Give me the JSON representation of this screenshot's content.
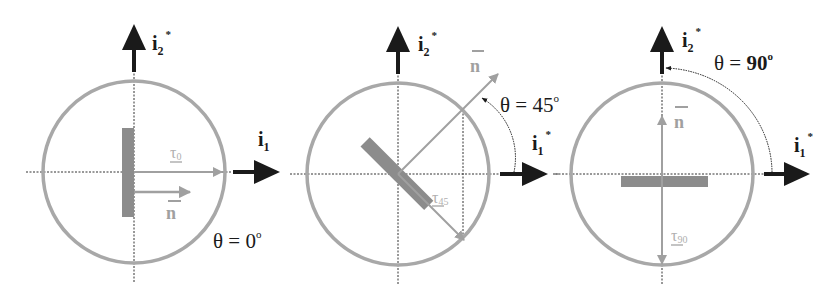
{
  "colors": {
    "axis": "#1a1a1a",
    "circle": "#a8a8a8",
    "vector": "#a0a0a0",
    "plate": "#8c8c8c",
    "background": "#ffffff"
  },
  "axes_labels": {
    "i1": "i",
    "i1_sub": "1",
    "i2": "i",
    "i2_sub": "2",
    "star": "*"
  },
  "panels": [
    {
      "id": "theta-0",
      "theta_deg": 0,
      "theta_label": "θ = 0°",
      "theta_text": "θ = 0",
      "degree": "o",
      "normal_label": "n",
      "traction_label": "τ",
      "traction_sub": "0"
    },
    {
      "id": "theta-45",
      "theta_deg": 45,
      "theta_label": "θ = 45°",
      "theta_text": "θ = 45",
      "degree": "o",
      "normal_label": "n",
      "traction_label": "τ",
      "traction_sub": "45"
    },
    {
      "id": "theta-90",
      "theta_deg": 90,
      "theta_label": "θ = 90°",
      "theta_text": "θ = 90",
      "degree": "o",
      "normal_label": "n",
      "traction_label": "τ",
      "traction_sub": "90"
    }
  ]
}
